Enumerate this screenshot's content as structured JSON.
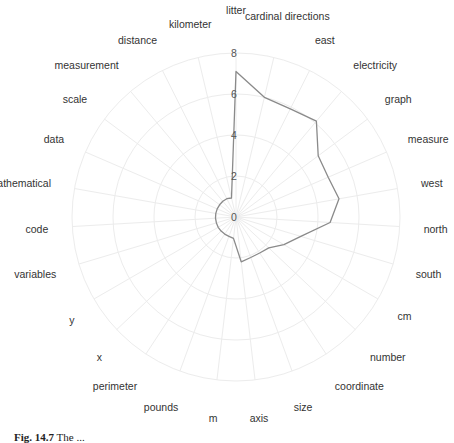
{
  "chart_data": {
    "type": "radar",
    "title": "",
    "categories": [
      "litter",
      "cardinal directions",
      "east",
      "electricity",
      "graph",
      "measure",
      "west",
      "north",
      "south",
      "cm",
      "number",
      "coordinate",
      "size",
      "axis",
      "m",
      "pounds",
      "perimeter",
      "x",
      "y",
      "variables",
      "code",
      "mathematical",
      "data",
      "scale",
      "measurement",
      "distance",
      "kilometer"
    ],
    "series": [
      {
        "name": "frequency",
        "values": [
          7.1,
          6.0,
          5.9,
          6.1,
          5.0,
          4.9,
          5.1,
          4.6,
          3.3,
          2.7,
          2.2,
          2.1,
          2.1,
          2.2,
          1.05,
          1.0,
          1.0,
          1.0,
          1.0,
          1.0,
          1.0,
          1.0,
          1.0,
          1.0,
          1.0,
          1.0,
          0.95
        ],
        "color": "#8a8a8a"
      }
    ],
    "rlim": [
      0,
      8
    ],
    "radial_ticks": [
      "0",
      "2",
      "4",
      "6",
      "8"
    ],
    "grid": true,
    "legend": "none"
  },
  "caption": {
    "label": "Fig. 14.7",
    "text": "The ..."
  }
}
